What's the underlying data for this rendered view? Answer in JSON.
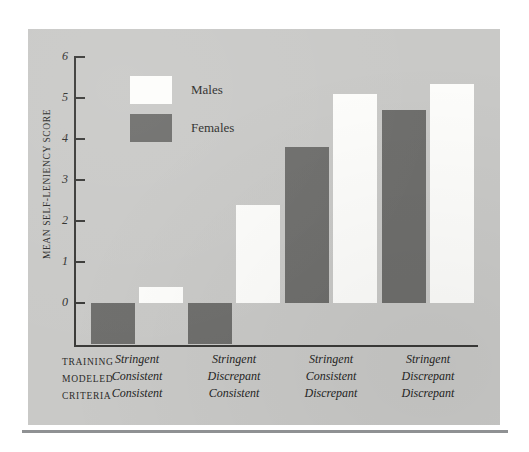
{
  "figure": {
    "panel_background": "#c9c9c7",
    "page_background": "#ffffff",
    "rule_color": "#8f9193"
  },
  "legend": {
    "position": "inside-top-left",
    "entries": [
      {
        "label": "Males",
        "color": "#fdfdfb",
        "swatch_name": "legend-swatch-males"
      },
      {
        "label": "Females",
        "color": "#6e6e6c",
        "swatch_name": "legend-swatch-females"
      }
    ]
  },
  "axis": {
    "y_title": "MEAN SELF-LENIENCY SCORE",
    "y_ticks": [
      "6",
      "5",
      "4",
      "3",
      "2",
      "1",
      "0"
    ]
  },
  "x_row_headers": [
    "TRAINING",
    "MODELED",
    "CRITERIA"
  ],
  "groups": [
    {
      "training": "Stringent",
      "modeled": "Consistent",
      "criteria": "Consistent"
    },
    {
      "training": "Stringent",
      "modeled": "Discrepant",
      "criteria": "Consistent"
    },
    {
      "training": "Stringent",
      "modeled": "Consistent",
      "criteria": "Discrepant"
    },
    {
      "training": "Stringent",
      "modeled": "Discrepant",
      "criteria": "Discrepant"
    }
  ],
  "chart_data": {
    "type": "bar",
    "title": "",
    "subtitle": "",
    "xlabel": "",
    "ylabel": "MEAN SELF-LENIENCY SCORE",
    "ylim": [
      -1.05,
      6
    ],
    "yticks": [
      0,
      1,
      2,
      3,
      4,
      5,
      6
    ],
    "grid": false,
    "legend_position": "inside-top-left",
    "categories": [
      "Stringent / Consistent / Consistent",
      "Stringent / Discrepant / Consistent",
      "Stringent / Consistent / Discrepant",
      "Stringent / Discrepant / Discrepant"
    ],
    "series": [
      {
        "name": "Males",
        "color": "#fdfdfb",
        "values": [
          0.4,
          2.4,
          5.1,
          5.35
        ]
      },
      {
        "name": "Females",
        "color": "#6e6e6c",
        "values": [
          -1.0,
          -1.0,
          3.8,
          4.7
        ]
      }
    ]
  }
}
